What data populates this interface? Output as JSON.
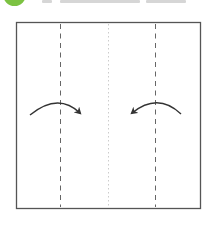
{
  "header": {
    "step_badge_color": "#7cc242",
    "title_text_visible": false
  },
  "diagram": {
    "paper": {
      "x": 16.5,
      "y": 22.5,
      "width": 184,
      "height": 186,
      "stroke": "#555555"
    },
    "fold_lines": [
      {
        "name": "left-valley-fold",
        "x": 60.5,
        "style": "dashed",
        "color": "#666666"
      },
      {
        "name": "center-crease",
        "x": 108.5,
        "style": "dotted",
        "color": "#cccccc"
      },
      {
        "name": "right-valley-fold",
        "x": 155.5,
        "style": "dashed",
        "color": "#666666"
      }
    ],
    "arrows": [
      {
        "name": "fold-arrow-left-to-center",
        "direction": "right"
      },
      {
        "name": "fold-arrow-right-to-center",
        "direction": "left"
      }
    ],
    "arrow_color": "#333333"
  }
}
